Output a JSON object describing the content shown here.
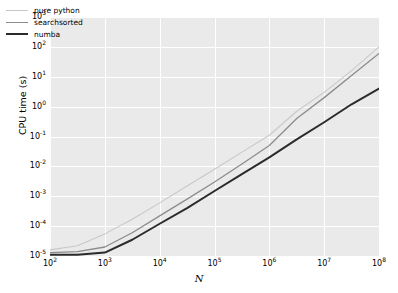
{
  "figure": {
    "background": "#ffffff",
    "plot_background": "#eaeaea",
    "gridline_color": "#ffffff"
  },
  "axis": {
    "ylabel": "CPU time (s)",
    "xlabel": "N",
    "y_ticks": [
      {
        "mantissa": "10",
        "exponent": "3"
      },
      {
        "mantissa": "10",
        "exponent": "2"
      },
      {
        "mantissa": "10",
        "exponent": "1"
      },
      {
        "mantissa": "10",
        "exponent": "0"
      },
      {
        "mantissa": "10",
        "exponent": "-1"
      },
      {
        "mantissa": "10",
        "exponent": "-2"
      },
      {
        "mantissa": "10",
        "exponent": "-3"
      },
      {
        "mantissa": "10",
        "exponent": "-4"
      },
      {
        "mantissa": "10",
        "exponent": "-5"
      }
    ],
    "x_ticks": [
      {
        "mantissa": "10",
        "exponent": "2"
      },
      {
        "mantissa": "10",
        "exponent": "3"
      },
      {
        "mantissa": "10",
        "exponent": "4"
      },
      {
        "mantissa": "10",
        "exponent": "5"
      },
      {
        "mantissa": "10",
        "exponent": "6"
      },
      {
        "mantissa": "10",
        "exponent": "7"
      },
      {
        "mantissa": "10",
        "exponent": "8"
      }
    ]
  },
  "legend": {
    "entries": [
      {
        "label": "pure python",
        "color": "#c8c8c8",
        "width": 1.1
      },
      {
        "label": "searchsorted",
        "color": "#8c8c8c",
        "width": 1.3
      },
      {
        "label": "numba",
        "color": "#2b2b2b",
        "width": 2.0
      }
    ]
  },
  "chart_data": {
    "type": "line",
    "title": "",
    "xlabel": "N",
    "ylabel": "CPU time (s)",
    "xscale": "log",
    "yscale": "log",
    "xlim": [
      100,
      100000000
    ],
    "ylim": [
      1e-05,
      1000
    ],
    "grid": true,
    "legend_position": "upper left",
    "x": [
      100,
      316,
      1000,
      3160,
      10000,
      31600,
      100000,
      316000,
      1000000,
      3160000,
      10000000,
      31600000,
      100000000
    ],
    "series": [
      {
        "name": "pure python",
        "color": "#c8c8c8",
        "values": [
          1.6e-05,
          2.2e-05,
          5.5e-05,
          0.00017,
          0.0006,
          0.0022,
          0.008,
          0.03,
          0.11,
          0.7,
          3.0,
          16.0,
          100.0
        ]
      },
      {
        "name": "searchsorted",
        "color": "#8c8c8c",
        "values": [
          1.3e-05,
          1.4e-05,
          2e-05,
          6e-05,
          0.00022,
          0.0008,
          0.003,
          0.012,
          0.05,
          0.4,
          2.0,
          11.0,
          60.0
        ]
      },
      {
        "name": "numba",
        "color": "#2b2b2b",
        "values": [
          1.1e-05,
          1.1e-05,
          1.3e-05,
          3.5e-05,
          0.00012,
          0.0004,
          0.0015,
          0.0055,
          0.02,
          0.08,
          0.3,
          1.2,
          4.0
        ]
      }
    ]
  }
}
